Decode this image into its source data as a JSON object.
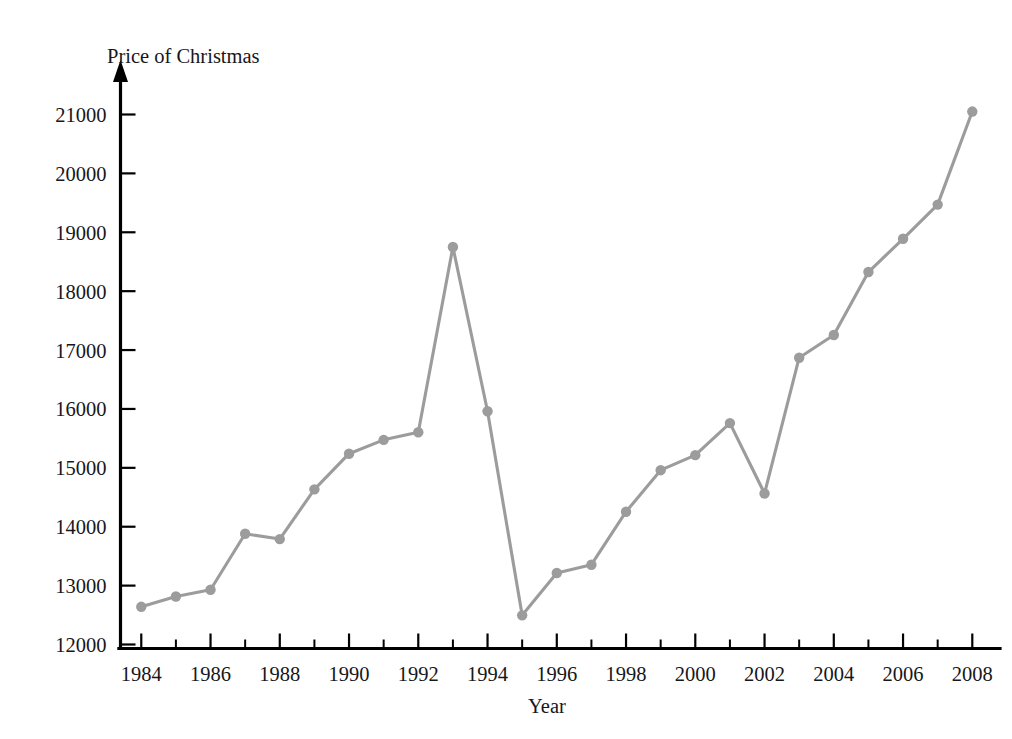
{
  "chart_data": {
    "type": "line",
    "title": "",
    "xlabel": "Year",
    "ylabel": "Price of Christmas",
    "xlim": [
      1983.4,
      2008.8
    ],
    "ylim": [
      12000,
      21400
    ],
    "grid": false,
    "legend": false,
    "series_color": "#9c9c9c",
    "x": [
      1984,
      1985,
      1986,
      1987,
      1988,
      1989,
      1990,
      1991,
      1992,
      1993,
      1994,
      1995,
      1996,
      1997,
      1998,
      1999,
      2000,
      2001,
      2002,
      2003,
      2004,
      2005,
      2006,
      2007,
      2008
    ],
    "values": [
      12640,
      12815,
      12930,
      13880,
      13790,
      14635,
      15240,
      15475,
      15605,
      18750,
      15960,
      12495,
      13215,
      13355,
      14255,
      14960,
      15215,
      15760,
      14565,
      16870,
      17255,
      18325,
      18890,
      19470,
      21050
    ],
    "y_ticks": [
      12000,
      13000,
      14000,
      15000,
      16000,
      17000,
      18000,
      19000,
      20000,
      21000
    ],
    "y_tick_labels": [
      "12000",
      "13000",
      "14000",
      "15000",
      "16000",
      "17000",
      "18000",
      "19000",
      "20000",
      "21000"
    ],
    "x_ticks": [
      1984,
      1986,
      1988,
      1990,
      1992,
      1994,
      1996,
      1998,
      2000,
      2002,
      2004,
      2006,
      2008
    ],
    "x_tick_labels": [
      "1984",
      "1986",
      "1988",
      "1990",
      "1992",
      "1994",
      "1996",
      "1998",
      "2000",
      "2002",
      "2004",
      "2006",
      "2008"
    ],
    "x_minor_ticks": [
      1985,
      1987,
      1989,
      1991,
      1993,
      1995,
      1997,
      1999,
      2001,
      2003,
      2005,
      2007
    ]
  }
}
